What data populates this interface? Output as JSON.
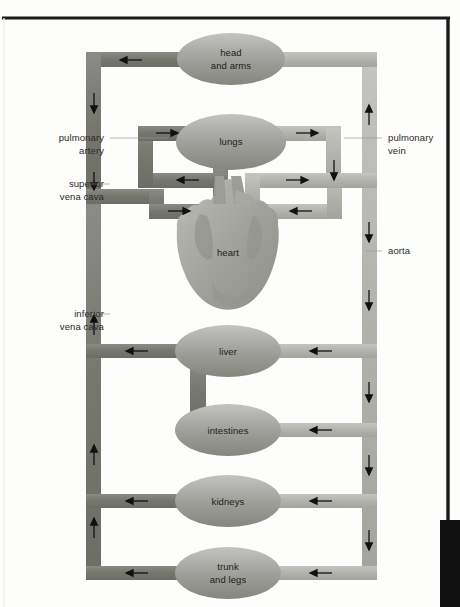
{
  "diagram": {
    "colors": {
      "deoxygenated_vessel": "#7c7c7a",
      "oxygenated_vessel": "#b3b3b0",
      "organ_fill": "#9b9b98",
      "organ_fill_light": "#bcbcb8",
      "heart_fill": "#a5a5a1",
      "text": "#1d1d1b",
      "leader_line": "#9a9a96",
      "page_border": "#1a1a1a",
      "background": "#fdfdfc"
    },
    "organs": [
      {
        "id": "head-and-arms",
        "label_line1": "head",
        "label_line2": "and arms",
        "cx": 231,
        "cy": 59,
        "rx": 54,
        "ry": 26
      },
      {
        "id": "lungs",
        "label_line1": "lungs",
        "label_line2": "",
        "cx": 231,
        "cy": 142,
        "rx": 55,
        "ry": 28
      },
      {
        "id": "heart",
        "label_line1": "heart",
        "label_line2": "",
        "cx": 228,
        "cy": 252,
        "rx": 48,
        "ry": 58
      },
      {
        "id": "liver",
        "label_line1": "liver",
        "label_line2": "",
        "cx": 228,
        "cy": 351,
        "rx": 53,
        "ry": 26
      },
      {
        "id": "intestines",
        "label_line1": "intestines",
        "label_line2": "",
        "cx": 228,
        "cy": 430,
        "rx": 53,
        "ry": 26
      },
      {
        "id": "kidneys",
        "label_line1": "kidneys",
        "label_line2": "",
        "cx": 228,
        "cy": 501,
        "rx": 53,
        "ry": 26
      },
      {
        "id": "trunk-and-legs",
        "label_line1": "trunk",
        "label_line2": "and legs",
        "cx": 228,
        "cy": 573,
        "rx": 53,
        "ry": 26
      }
    ],
    "callouts": [
      {
        "id": "pulmonary-artery",
        "line1": "pulmonary",
        "line2": "artery",
        "side": "left",
        "text_x": 104,
        "text_y": 141,
        "leader_x1": 108,
        "leader_x2": 168,
        "leader_y": 138
      },
      {
        "id": "superior-vena-cava",
        "line1": "superior",
        "line2": "vena cava",
        "side": "left",
        "text_x": 104,
        "text_y": 187,
        "leader_x1": 108,
        "leader_x2": 93,
        "leader_y": 184
      },
      {
        "id": "inferior-vena-cava",
        "line1": "inferior",
        "line2": "vena cava",
        "side": "left",
        "text_x": 104,
        "text_y": 317,
        "leader_x1": 108,
        "leader_x2": 93,
        "leader_y": 314
      },
      {
        "id": "pulmonary-vein",
        "line1": "pulmonary",
        "line2": "vein",
        "side": "right",
        "text_x": 388,
        "text_y": 141,
        "leader_x1": 384,
        "leader_x2": 352,
        "leader_y": 138
      },
      {
        "id": "aorta",
        "line1": "aorta",
        "line2": "",
        "side": "right",
        "text_x": 388,
        "text_y": 254,
        "leader_x1": 384,
        "leader_x2": 366,
        "leader_y": 251
      }
    ],
    "flow_arrows": [
      {
        "id": "arrow-head-return",
        "x": 130,
        "y": 60,
        "dir": "left"
      },
      {
        "id": "arrow-svc-down",
        "x": 96,
        "y": 104,
        "dir": "down"
      },
      {
        "id": "arrow-svc-down-2",
        "x": 96,
        "y": 182,
        "dir": "down"
      },
      {
        "id": "arrow-pulm-artery",
        "x": 168,
        "y": 133,
        "dir": "right"
      },
      {
        "id": "arrow-pulm-vein",
        "x": 310,
        "y": 133,
        "dir": "right"
      },
      {
        "id": "arrow-aorta-up",
        "x": 369,
        "y": 113,
        "dir": "up"
      },
      {
        "id": "arrow-pv-down",
        "x": 333,
        "y": 170,
        "dir": "down"
      },
      {
        "id": "arrow-lung-return-left",
        "x": 187,
        "y": 180,
        "dir": "left"
      },
      {
        "id": "arrow-heart-out-right",
        "x": 300,
        "y": 180,
        "dir": "right"
      },
      {
        "id": "arrow-svc-into-heart",
        "x": 180,
        "y": 211,
        "dir": "right"
      },
      {
        "id": "arrow-aorta-into-heart",
        "x": 300,
        "y": 211,
        "dir": "left"
      },
      {
        "id": "arrow-aorta-down-1",
        "x": 369,
        "y": 232,
        "dir": "down"
      },
      {
        "id": "arrow-aorta-down-2",
        "x": 369,
        "y": 300,
        "dir": "down"
      },
      {
        "id": "arrow-ivc-up",
        "x": 96,
        "y": 347,
        "dir": "up"
      },
      {
        "id": "arrow-liver-out",
        "x": 136,
        "y": 351,
        "dir": "left"
      },
      {
        "id": "arrow-liver-in",
        "x": 320,
        "y": 351,
        "dir": "left"
      },
      {
        "id": "arrow-aorta-down-3",
        "x": 369,
        "y": 392,
        "dir": "down"
      },
      {
        "id": "arrow-intestines-in",
        "x": 320,
        "y": 430,
        "dir": "left"
      },
      {
        "id": "arrow-ivc-up-2",
        "x": 96,
        "y": 455,
        "dir": "up"
      },
      {
        "id": "arrow-aorta-down-4",
        "x": 369,
        "y": 465,
        "dir": "down"
      },
      {
        "id": "arrow-kidneys-out",
        "x": 136,
        "y": 501,
        "dir": "left"
      },
      {
        "id": "arrow-kidneys-in",
        "x": 320,
        "y": 501,
        "dir": "left"
      },
      {
        "id": "arrow-ivc-up-3",
        "x": 96,
        "y": 528,
        "dir": "up"
      },
      {
        "id": "arrow-aorta-down-5",
        "x": 369,
        "y": 540,
        "dir": "down"
      },
      {
        "id": "arrow-trunk-out",
        "x": 136,
        "y": 573,
        "dir": "left"
      },
      {
        "id": "arrow-trunk-in",
        "x": 320,
        "y": 573,
        "dir": "left"
      }
    ]
  }
}
